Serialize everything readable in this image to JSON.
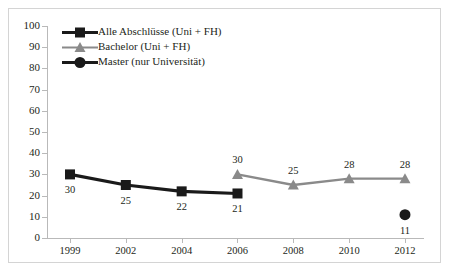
{
  "chart_data": {
    "type": "line",
    "title": "",
    "xlabel": "",
    "ylabel": "",
    "categories": [
      "1999",
      "2002",
      "2004",
      "2006",
      "2008",
      "2010",
      "2012"
    ],
    "ylim": [
      0,
      100
    ],
    "yticks": [
      0,
      10,
      20,
      30,
      40,
      50,
      60,
      70,
      80,
      90,
      100
    ],
    "grid": false,
    "legend_position": "top-left",
    "series": [
      {
        "name": "Alle Abschlüsse (Uni + FH)",
        "color": "#1a1a1a",
        "marker": "square",
        "x": [
          "1999",
          "2002",
          "2004",
          "2006"
        ],
        "values": [
          30,
          25,
          22,
          21
        ],
        "labels": [
          "30",
          "25",
          "22",
          "21"
        ],
        "label_position": "below"
      },
      {
        "name": "Bachelor (Uni + FH)",
        "color": "#8a8a8a",
        "marker": "triangle",
        "x": [
          "2006",
          "2008",
          "2010",
          "2012"
        ],
        "values": [
          30,
          25,
          28,
          28
        ],
        "labels": [
          "30",
          "25",
          "28",
          "28"
        ],
        "label_position": "above"
      },
      {
        "name": "Master (nur Universität)",
        "color": "#1a1a1a",
        "marker": "circle",
        "x": [
          "2012"
        ],
        "values": [
          11
        ],
        "labels": [
          "11"
        ],
        "label_position": "below"
      }
    ]
  },
  "axis": {
    "y_tick_labels": [
      "100",
      "90",
      "80",
      "70",
      "60",
      "50",
      "40",
      "30",
      "20",
      "10",
      "0"
    ],
    "x_tick_labels": [
      "1999",
      "2002",
      "2004",
      "2006",
      "2008",
      "2010",
      "2012"
    ]
  },
  "legend": {
    "items": [
      {
        "label": "Alle Abschlüsse (Uni + FH)",
        "color": "#1a1a1a",
        "marker": "square-marker-icon"
      },
      {
        "label": "Bachelor (Uni + FH)",
        "color": "#8a8a8a",
        "marker": "triangle-marker-icon"
      },
      {
        "label": "Master (nur Universität)",
        "color": "#1a1a1a",
        "marker": "circle-marker-icon"
      }
    ]
  },
  "colors": {
    "series_black": "#1a1a1a",
    "series_gray": "#8a8a8a",
    "axis": "#b9b9b9",
    "frame": "#d4d4d4",
    "text": "#231f20"
  }
}
